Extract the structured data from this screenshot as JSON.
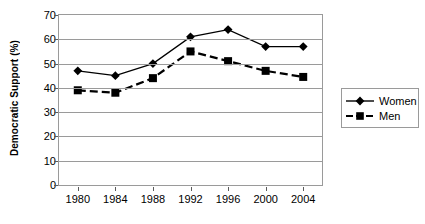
{
  "chart_data": {
    "type": "line",
    "title": "",
    "xlabel": "",
    "ylabel": "Democratic Support (%)",
    "categories": [
      "1980",
      "1984",
      "1988",
      "1992",
      "1996",
      "2000",
      "2004"
    ],
    "x": [
      1980,
      1984,
      1988,
      1992,
      1996,
      2000,
      2004
    ],
    "ylim": [
      0,
      70
    ],
    "yticks": [
      0,
      10,
      20,
      30,
      40,
      50,
      60,
      70
    ],
    "grid": true,
    "legend_position": "right",
    "series": [
      {
        "name": "Women",
        "values": [
          47,
          45,
          50,
          61,
          64,
          57,
          57
        ],
        "marker": "diamond",
        "line_style": "solid",
        "color": "#000000"
      },
      {
        "name": "Men",
        "values": [
          39,
          38,
          44,
          55,
          51,
          47,
          44.5
        ],
        "marker": "square",
        "line_style": "dashed",
        "color": "#000000"
      }
    ]
  },
  "axis": {
    "y_label": "Democratic Support (%)",
    "y_ticks": [
      "0",
      "10",
      "20",
      "30",
      "40",
      "50",
      "60",
      "70"
    ],
    "x_ticks": [
      "1980",
      "1984",
      "1988",
      "1992",
      "1996",
      "2000",
      "2004"
    ]
  },
  "legend": {
    "entries": [
      {
        "label": "Women"
      },
      {
        "label": "Men"
      }
    ]
  },
  "colors": {
    "axis": "#9a9a9a",
    "series": "#000000",
    "background": "#ffffff",
    "text": "#000000"
  }
}
